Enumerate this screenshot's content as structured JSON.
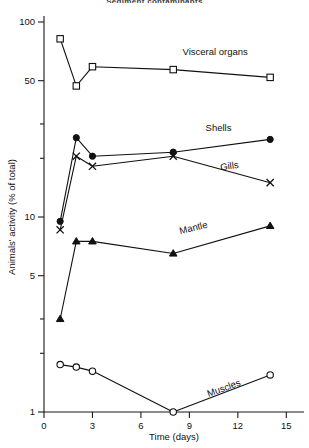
{
  "figure": {
    "cut_off_title": "Sediment contaminants",
    "background": "#ffffff",
    "ink_color": "#111111"
  },
  "chart_data": {
    "type": "line",
    "title": "",
    "xlabel": "Time (days)",
    "ylabel": "Animals' activity (% of total)",
    "yscale": "log",
    "ylim": [
      1,
      100
    ],
    "xlim": [
      0,
      15.6
    ],
    "xticks": [
      0,
      3,
      6,
      9,
      12,
      15
    ],
    "xtick_labels": [
      "0",
      "3",
      "6",
      "9",
      "12",
      "15"
    ],
    "yticks": [
      1,
      2,
      3,
      5,
      10,
      20,
      30,
      50,
      100
    ],
    "ytick_labels_shown": [
      "1",
      "5",
      "10",
      "50",
      "100"
    ],
    "grid": false,
    "legend": "inline-annotations",
    "series": [
      {
        "name": "Visceral organs",
        "marker": "open-square",
        "x": [
          1,
          2,
          3,
          8,
          14
        ],
        "values": [
          82,
          47,
          59,
          57,
          52
        ],
        "label_x": 10.6,
        "label_y": 68
      },
      {
        "name": "Shells",
        "marker": "filled-circle",
        "x": [
          1,
          2,
          3,
          8,
          14
        ],
        "values": [
          9.5,
          25.5,
          20.5,
          21.5,
          25
        ],
        "label_x": 10.8,
        "label_y": 27.5
      },
      {
        "name": "Gills",
        "marker": "cross",
        "x": [
          1,
          2,
          3,
          8,
          14
        ],
        "values": [
          8.6,
          20.5,
          18.2,
          20.5,
          15
        ],
        "label_x": 11.5,
        "label_y": 17.6
      },
      {
        "name": "Mantle",
        "marker": "filled-triangle",
        "x": [
          1,
          2,
          3,
          8,
          14
        ],
        "values": [
          3.0,
          7.5,
          7.5,
          6.5,
          9.0
        ],
        "label_x": 9.3,
        "label_y": 8.5
      },
      {
        "name": "Muscles",
        "marker": "open-circle",
        "x": [
          1,
          2,
          3,
          8,
          14
        ],
        "values": [
          1.75,
          1.7,
          1.62,
          1.0,
          1.55
        ],
        "label_x": 11.2,
        "label_y": 1.28
      }
    ]
  }
}
